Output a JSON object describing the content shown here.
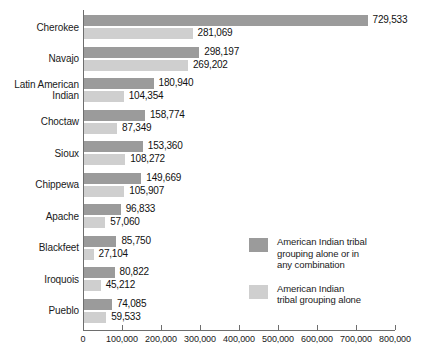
{
  "chart_data": {
    "type": "bar",
    "orientation": "horizontal",
    "title": "",
    "xlabel": "",
    "ylabel": "",
    "xlim": [
      0,
      800000
    ],
    "xticks": [
      0,
      100000,
      200000,
      300000,
      400000,
      500000,
      600000,
      700000,
      800000
    ],
    "xtick_labels": [
      "0",
      "100,000",
      "200,000",
      "300,000",
      "400,000",
      "500,000",
      "600,000",
      "700,000",
      "800,000"
    ],
    "grid": false,
    "legend_position": "lower-right-inside",
    "categories": [
      "Cherokee",
      "Navajo",
      "Latin American\nIndian",
      "Choctaw",
      "Sioux",
      "Chippewa",
      "Apache",
      "Blackfeet",
      "Iroquois",
      "Pueblo"
    ],
    "series": [
      {
        "name": "American Indian tribal\ngrouping alone or in\nany combination",
        "color": "#9b9b9b",
        "values": [
          729533,
          298197,
          180940,
          158774,
          153360,
          149669,
          96833,
          85750,
          80822,
          74085
        ],
        "value_labels": [
          "729,533",
          "298,197",
          "180,940",
          "158,774",
          "153,360",
          "149,669",
          "96,833",
          "85,750",
          "80,822",
          "74,085"
        ]
      },
      {
        "name": "American Indian\ntribal grouping alone",
        "color": "#cfcfcf",
        "values": [
          281069,
          269202,
          104354,
          87349,
          108272,
          105907,
          57060,
          27104,
          45212,
          59533
        ],
        "value_labels": [
          "281,069",
          "269,202",
          "104,354",
          "87,349",
          "108,272",
          "105,907",
          "57,060",
          "27,104",
          "45,212",
          "59,533"
        ]
      }
    ]
  }
}
